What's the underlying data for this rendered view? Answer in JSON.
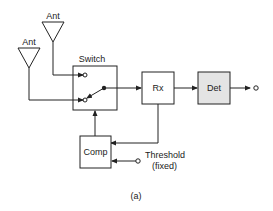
{
  "diagram": {
    "antennas": [
      {
        "label": "Ant"
      },
      {
        "label": "Ant"
      }
    ],
    "blocks": {
      "switch": {
        "label": "Switch"
      },
      "receiver": {
        "label": "Rx"
      },
      "detector": {
        "label": "Det"
      },
      "comparator": {
        "label": "Comp"
      }
    },
    "threshold": {
      "line1": "Threshold",
      "line2": "(fixed)"
    },
    "caption": "(a)",
    "colors": {
      "line": "#222222",
      "detector_fill": "#e4e4e4"
    }
  }
}
